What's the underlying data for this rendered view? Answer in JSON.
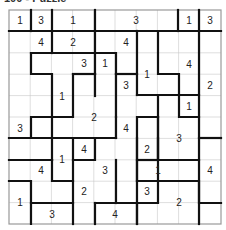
{
  "title": "100 - Puzzle",
  "grid": {
    "cols": 10,
    "rows": 10,
    "left": 9,
    "top": 10,
    "right": 221,
    "bottom": 224
  },
  "clues": [
    {
      "x": 20,
      "y": 20,
      "v": "1"
    },
    {
      "x": 41,
      "y": 20,
      "v": "3"
    },
    {
      "x": 73,
      "y": 20,
      "v": "1"
    },
    {
      "x": 136,
      "y": 20,
      "v": "3"
    },
    {
      "x": 189,
      "y": 20,
      "v": "1"
    },
    {
      "x": 210,
      "y": 20,
      "v": "3"
    },
    {
      "x": 41,
      "y": 42,
      "v": "4"
    },
    {
      "x": 73,
      "y": 42,
      "v": "2"
    },
    {
      "x": 126,
      "y": 42,
      "v": "4"
    },
    {
      "x": 84,
      "y": 63,
      "v": "3"
    },
    {
      "x": 105,
      "y": 63,
      "v": "1"
    },
    {
      "x": 189,
      "y": 64,
      "v": "4"
    },
    {
      "x": 147,
      "y": 74,
      "v": "1"
    },
    {
      "x": 126,
      "y": 85,
      "v": "3"
    },
    {
      "x": 210,
      "y": 85,
      "v": "2"
    },
    {
      "x": 62,
      "y": 96,
      "v": "1"
    },
    {
      "x": 189,
      "y": 106,
      "v": "1"
    },
    {
      "x": 94,
      "y": 117,
      "v": "2"
    },
    {
      "x": 20,
      "y": 128,
      "v": "3"
    },
    {
      "x": 126,
      "y": 128,
      "v": "4"
    },
    {
      "x": 179,
      "y": 138,
      "v": "3"
    },
    {
      "x": 84,
      "y": 149,
      "v": "4"
    },
    {
      "x": 147,
      "y": 149,
      "v": "2"
    },
    {
      "x": 62,
      "y": 159,
      "v": "1"
    },
    {
      "x": 41,
      "y": 170,
      "v": "4"
    },
    {
      "x": 105,
      "y": 170,
      "v": "3"
    },
    {
      "x": 158,
      "y": 170,
      "v": "1"
    },
    {
      "x": 210,
      "y": 170,
      "v": "4"
    },
    {
      "x": 84,
      "y": 191,
      "v": "2"
    },
    {
      "x": 147,
      "y": 191,
      "v": "3"
    },
    {
      "x": 20,
      "y": 202,
      "v": "1"
    },
    {
      "x": 179,
      "y": 202,
      "v": "2"
    },
    {
      "x": 52,
      "y": 214,
      "v": "3"
    },
    {
      "x": 115,
      "y": 214,
      "v": "4"
    }
  ],
  "walls": [
    "M9 31H221",
    "M31 10V31",
    "M52 10V31",
    "M95 10V31",
    "M178 10V31",
    "M199 10V31",
    "M52 31V53",
    "M95 31V53",
    "M137 31V95",
    "M158 31V74H179V95",
    "M199 31V224",
    "M31 53H116V74",
    "M95 53V74",
    "M116 74H137",
    "M31 53V74H52V117",
    "M73 74V117H52",
    "M73 74H95V74",
    "M95 74V96",
    "M116 74V117",
    "M137 95H158V117H137V224",
    "M158 95H199",
    "M179 95V117H199",
    "M9 138H31V117H52",
    "M52 117V160",
    "M116 117V138",
    "M31 138H116",
    "M73 138V160H95V138",
    "M158 117V181",
    "M137 138V181",
    "M158 160V117",
    "M137 160H158",
    "M158 138V160H199",
    "M199 138H221",
    "M9 160H52",
    "M52 160V181H73",
    "M73 160V224",
    "M9 181H31V224",
    "M31 203H73",
    "M116 160V203",
    "M95 203H137",
    "M95 203V224",
    "M137 181H158V203H137",
    "M158 181H199V203H221",
    "M137 203V224"
  ]
}
